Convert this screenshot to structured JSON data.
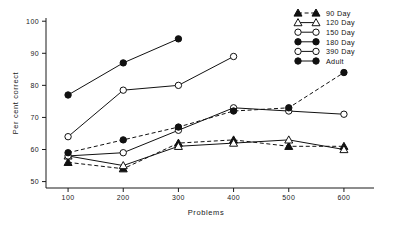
{
  "chart_data": {
    "type": "line",
    "title": "",
    "xlabel": "Problems",
    "ylabel": "Per cent correct",
    "x": [
      100,
      200,
      300,
      400,
      500,
      600
    ],
    "xlim": [
      60,
      640
    ],
    "ylim": [
      48,
      101
    ],
    "xticks": [
      "100",
      "200",
      "300",
      "400",
      "500",
      "600"
    ],
    "yticks": [
      "100",
      "90",
      "80",
      "70",
      "60",
      "50"
    ],
    "grid": false,
    "legend_position": "top-right",
    "series": [
      {
        "name": "90 Day",
        "marker": "filled-triangle",
        "line": "dashed",
        "x": [
          100,
          200,
          300,
          400,
          500,
          600
        ],
        "values": [
          56,
          54,
          62,
          63,
          61,
          61
        ]
      },
      {
        "name": "120 Day",
        "marker": "open-triangle",
        "line": "solid",
        "x": [
          100,
          200,
          300,
          400,
          500,
          600
        ],
        "values": [
          58,
          55,
          61,
          62,
          63,
          60
        ]
      },
      {
        "name": "150 Day",
        "marker": "open-circle",
        "line": "solid",
        "x": [
          100,
          200,
          300,
          400,
          500,
          600
        ],
        "values": [
          58,
          59,
          66,
          73,
          72,
          71
        ]
      },
      {
        "name": "180 Day",
        "marker": "filled-circle",
        "line": "dashed",
        "x": [
          100,
          200,
          300,
          400,
          500,
          600
        ],
        "values": [
          59,
          63,
          67,
          72,
          73,
          84
        ]
      },
      {
        "name": "390 Day",
        "marker": "open-circle",
        "line": "solid",
        "x": [
          100,
          200,
          300,
          400
        ],
        "values": [
          64,
          78.5,
          80,
          89
        ]
      },
      {
        "name": "Adult",
        "marker": "filled-circle",
        "line": "solid",
        "x": [
          100,
          200,
          300
        ],
        "values": [
          77,
          87,
          94.5
        ]
      }
    ]
  },
  "legend": {
    "entries": [
      {
        "label": "90 Day",
        "marker": "filled-triangle",
        "line": "dashed"
      },
      {
        "label": "120 Day",
        "marker": "open-triangle",
        "line": "solid"
      },
      {
        "label": "150 Day",
        "marker": "open-circle",
        "line": "solid"
      },
      {
        "label": "180 Day",
        "marker": "filled-circle",
        "line": "solid"
      },
      {
        "label": "390 Day",
        "marker": "open-circle",
        "line": "solid"
      },
      {
        "label": "Adult",
        "marker": "filled-circle",
        "line": "solid"
      }
    ]
  },
  "colors": {
    "ink": "#111111",
    "background": "#ffffff"
  }
}
